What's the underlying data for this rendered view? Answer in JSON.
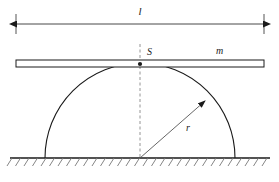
{
  "figure": {
    "background_color": "#ffffff",
    "line_color": "#1a1a1a",
    "thin_line_color": "#555555",
    "hatch_color": "#777777"
  },
  "labels": {
    "length": "l",
    "contact_point": "S",
    "mass": "m",
    "radius": "r"
  },
  "dimension_line": {
    "name": "overall-length",
    "label": "l",
    "y": 24,
    "x_start": 16,
    "x_end": 264,
    "tick_top": 14,
    "tick_bottom": 34,
    "arrowheads": "both"
  },
  "rod": {
    "name": "rod",
    "label": "m",
    "x_start": 16,
    "x_end": 264,
    "y_top": 60,
    "y_bottom": 67,
    "fill": "#ffffff",
    "stroke": "#1a1a1a"
  },
  "semicircle": {
    "name": "semicircular-body",
    "center_x": 140,
    "center_y": 158,
    "radius": 95,
    "base_left_x": 45,
    "base_right_x": 235,
    "apex_y": 63,
    "stroke": "#1a1a1a"
  },
  "center_line": {
    "name": "vertical-center-line",
    "x": 140,
    "y_top": 44,
    "y_bottom": 158,
    "style": "dashed"
  },
  "radius_arrow": {
    "name": "radius-indicator",
    "label": "r",
    "from_x": 140,
    "from_y": 158,
    "to_x": 207,
    "to_y": 100,
    "label_x": 187,
    "label_y": 128
  },
  "contact_point": {
    "name": "contact-point-S",
    "label": "S",
    "x": 140,
    "y": 64,
    "label_x": 146,
    "label_y": 54
  },
  "ground": {
    "name": "ground-line",
    "y": 158,
    "x_start": 10,
    "x_end": 270,
    "hatch_count": 31,
    "hatch_spacing": 8.5,
    "hatch_length": 9,
    "hatch_angle_deg": 55
  },
  "mass_label": {
    "name": "mass-label-m",
    "text": "m",
    "x": 216,
    "y": 53
  },
  "length_label": {
    "name": "length-label-l",
    "text": "l",
    "x": 140,
    "y": 14
  }
}
